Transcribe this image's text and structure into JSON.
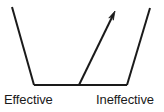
{
  "figure": {
    "type": "line-diagram",
    "background_color": "#ffffff",
    "stroke_color": "#1a1a1a",
    "stroke_width": 2,
    "shapes": {
      "left_wall": {
        "name": "left-wall-line",
        "x1": 12,
        "y1": 7,
        "x2": 34,
        "y2": 85
      },
      "baseline": {
        "name": "baseline",
        "x1": 34,
        "y1": 85,
        "x2": 127,
        "y2": 85
      },
      "right_wall": {
        "name": "right-wall-line",
        "x1": 127,
        "y1": 85,
        "x2": 150,
        "y2": 8
      },
      "arrow": {
        "name": "upward-arrow",
        "x1": 79,
        "y1": 85,
        "x2": 115,
        "y2": 11,
        "head_length": 9,
        "head_width": 5
      }
    }
  },
  "labels": {
    "left": "Effective",
    "right": "Ineffective"
  }
}
